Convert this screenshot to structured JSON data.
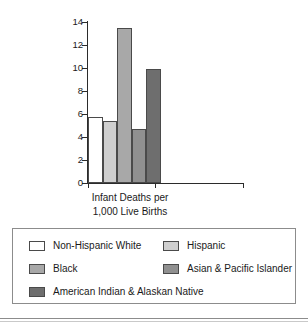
{
  "chart_data": {
    "type": "bar",
    "title": "",
    "xlabel": "Infant Deaths per 1,000 Live Births",
    "xlabel_lines": [
      "Infant Deaths per",
      "1,000 Live Births"
    ],
    "ylabel": "",
    "ylim": [
      0,
      14
    ],
    "yticks": [
      0,
      2,
      4,
      6,
      8,
      10,
      12,
      14
    ],
    "ytick_labels": [
      "0",
      "2",
      "4",
      "6",
      "8",
      "10",
      "12",
      "14"
    ],
    "grid": false,
    "legend_position": "bottom",
    "categories": [
      "Non-Hispanic White",
      "Hispanic",
      "Black",
      "Asian & Pacific Islander",
      "American Indian & Alaskan Native"
    ],
    "values": [
      5.7,
      5.4,
      13.5,
      4.7,
      9.9
    ],
    "colors": [
      "#ffffff",
      "#cfcfcf",
      "#a8a8a8",
      "#909090",
      "#6e6e6e"
    ],
    "bar_edge_color": "#4a4a4a",
    "axis_color": "#2b2b2b"
  },
  "legend": {
    "entries": [
      {
        "label": "Non-Hispanic White",
        "color": "#ffffff"
      },
      {
        "label": "Hispanic",
        "color": "#cfcfcf"
      },
      {
        "label": "Black",
        "color": "#a8a8a8"
      },
      {
        "label": "Asian & Pacific Islander",
        "color": "#909090"
      },
      {
        "label": "American Indian & Alaskan Native",
        "color": "#6e6e6e"
      }
    ]
  }
}
